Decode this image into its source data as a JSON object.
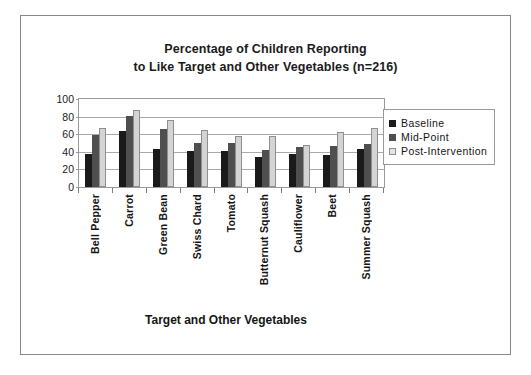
{
  "figure": {
    "border_color": "#8a8a8a",
    "background": "#ffffff"
  },
  "title": {
    "line1": "Percentage of Children Reporting",
    "line2": "to Like Target and Other Vegetables (n=216)"
  },
  "legend": {
    "position": "right",
    "items": [
      {
        "label": "Baseline",
        "color": "#1a1a1a",
        "swatch": "baseline"
      },
      {
        "label": "Mid-Point",
        "color": "#4f4f4f",
        "swatch": "midpoint"
      },
      {
        "label": "Post-Intervention",
        "color": "#e4e4e4",
        "swatch": "post"
      }
    ]
  },
  "chart_data": {
    "type": "bar",
    "title": "Percentage of Children Reporting to Like Target and Other Vegetables (n=216)",
    "xlabel": "Target and Other Vegetables",
    "ylabel": "",
    "ylim": [
      0,
      100
    ],
    "yticks": [
      0,
      20,
      40,
      60,
      80,
      100
    ],
    "grid": true,
    "legend_position": "right",
    "categories": [
      "Bell Pepper",
      "Carrot",
      "Green Bean",
      "Swiss Chard",
      "Tomato",
      "Butternut Squash",
      "Cauliflower",
      "Beet",
      "Summer Squash"
    ],
    "series": [
      {
        "name": "Baseline",
        "color": "#1a1a1a",
        "values": [
          38,
          64,
          43,
          41,
          41,
          34,
          38,
          36,
          43
        ]
      },
      {
        "name": "Mid-Point",
        "color": "#4f4f4f",
        "values": [
          59,
          81,
          66,
          50,
          50,
          42,
          45,
          47,
          49
        ]
      },
      {
        "name": "Post-Intervention",
        "color": "#e4e4e4",
        "values": [
          67,
          88,
          76,
          65,
          58,
          58,
          48,
          62,
          67
        ]
      }
    ]
  }
}
